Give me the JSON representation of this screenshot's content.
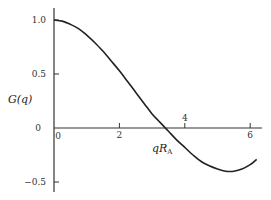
{
  "chart_data": {
    "type": "line",
    "title": "",
    "xlabel": "qR_A",
    "xlabel_main": "qR",
    "xlabel_sub": "A",
    "ylabel": "G(q)",
    "xlim": [
      0,
      6.3
    ],
    "ylim": [
      -0.55,
      1.1
    ],
    "x_ticks": [
      0,
      2,
      4,
      6
    ],
    "x_tick_labels": [
      "0",
      "2",
      "4",
      "6"
    ],
    "y_ticks": [
      1.0,
      0.5,
      0,
      -0.5
    ],
    "y_tick_labels": [
      "1.0",
      "0.5",
      "0",
      "−0.5"
    ],
    "grid": false,
    "series": [
      {
        "name": "G(q)",
        "x": [
          0,
          0.25,
          0.5,
          0.75,
          1.0,
          1.25,
          1.5,
          1.75,
          2.0,
          2.25,
          2.5,
          2.75,
          3.0,
          3.25,
          3.5,
          3.75,
          4.0,
          4.25,
          4.5,
          4.75,
          5.0,
          5.25,
          5.5,
          5.75,
          6.0,
          6.2
        ],
        "y": [
          1.0,
          0.99,
          0.96,
          0.92,
          0.86,
          0.79,
          0.71,
          0.62,
          0.53,
          0.43,
          0.33,
          0.23,
          0.13,
          0.05,
          -0.03,
          -0.11,
          -0.18,
          -0.25,
          -0.31,
          -0.35,
          -0.38,
          -0.4,
          -0.4,
          -0.38,
          -0.34,
          -0.29
        ]
      }
    ]
  }
}
